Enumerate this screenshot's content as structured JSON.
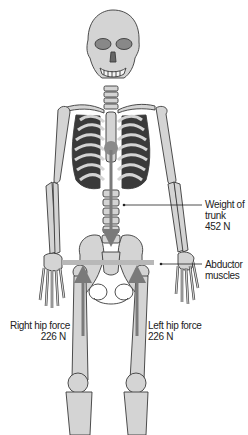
{
  "diagram": {
    "colors": {
      "bone_fill": "#d4d4d4",
      "bone_outline": "#3a3a3a",
      "force_arrow": "#7a7a7a",
      "abductor_bar": "#b8b8b8",
      "leader_line": "#222222",
      "text": "#222222"
    },
    "labels": {
      "trunk": {
        "line1": "Weight of",
        "line2": "trunk",
        "line3": "452 N"
      },
      "abductor": {
        "line1": "Abductor",
        "line2": "muscles"
      },
      "right_hip": {
        "line1": "Right hip force",
        "line2": "226 N"
      },
      "left_hip": {
        "line1": "Left hip force",
        "line2": "226 N"
      }
    },
    "forces": [
      {
        "name": "Weight of trunk",
        "value_N": 452,
        "direction": "down"
      },
      {
        "name": "Right hip force",
        "value_N": 226,
        "direction": "up"
      },
      {
        "name": "Left hip force",
        "value_N": 226,
        "direction": "up"
      }
    ]
  }
}
